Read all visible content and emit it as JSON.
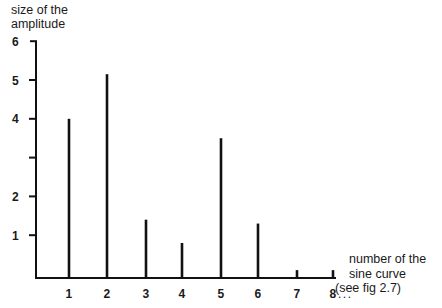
{
  "chart_data": {
    "type": "bar",
    "style": "stem/line bars",
    "title": "",
    "ylabel": "size of the amplitude",
    "xlabel": "number of the sine curve (see fig 2.7)",
    "xlabel_lines": [
      "number of the",
      "sine curve",
      "(see fig 2.7)"
    ],
    "ylabel_lines": [
      "size of the",
      "amplitude"
    ],
    "categories": [
      "1",
      "2",
      "3",
      "4",
      "5",
      "6",
      "7",
      "8"
    ],
    "category_suffix": "...",
    "values": [
      4.0,
      5.15,
      1.4,
      0.8,
      3.5,
      1.3,
      0.1,
      0.1
    ],
    "yticks": [
      1,
      2,
      3,
      4,
      5,
      6
    ],
    "ytick_labels": [
      "1",
      "2",
      "",
      "4",
      "5",
      "6"
    ],
    "ylim": [
      0,
      6
    ],
    "grid": false,
    "legend": null,
    "colors": {
      "line": "#111111",
      "text": "#1a1a1a",
      "background": "#ffffff"
    }
  }
}
